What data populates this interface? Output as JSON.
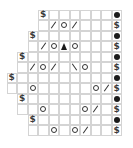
{
  "chart": {
    "columns": 11,
    "rows": [
      {
        "start": 3,
        "cells": [
          {
            "col": 3,
            "sym": "dollar"
          },
          {
            "col": 10,
            "sym": "bobble"
          }
        ]
      },
      {
        "start": 3,
        "cells": [
          {
            "col": 4,
            "sym": "k2tog"
          },
          {
            "col": 5,
            "sym": "yo"
          },
          {
            "col": 6,
            "sym": "k2tog"
          },
          {
            "col": 10,
            "sym": "dollar"
          }
        ]
      },
      {
        "start": 2,
        "cells": [
          {
            "col": 2,
            "sym": "dollar"
          },
          {
            "col": 10,
            "sym": "bobble"
          }
        ]
      },
      {
        "start": 2,
        "cells": [
          {
            "col": 3,
            "sym": "k2tog"
          },
          {
            "col": 4,
            "sym": "yo"
          },
          {
            "col": 5,
            "sym": "cdd"
          },
          {
            "col": 6,
            "sym": "yo"
          },
          {
            "col": 10,
            "sym": "dollar"
          }
        ]
      },
      {
        "start": 1,
        "cells": [
          {
            "col": 1,
            "sym": "dollar"
          },
          {
            "col": 10,
            "sym": "bobble"
          }
        ]
      },
      {
        "start": 1,
        "cells": [
          {
            "col": 2,
            "sym": "k2tog"
          },
          {
            "col": 3,
            "sym": "yo"
          },
          {
            "col": 4,
            "sym": "k2tog"
          },
          {
            "col": 6,
            "sym": "ssk"
          },
          {
            "col": 7,
            "sym": "yo"
          },
          {
            "col": 10,
            "sym": "dollar"
          }
        ]
      },
      {
        "start": 0,
        "cells": [
          {
            "col": 0,
            "sym": "dollar"
          },
          {
            "col": 10,
            "sym": "bobble"
          }
        ]
      },
      {
        "start": 0,
        "cells": [
          {
            "col": 2,
            "sym": "yo"
          },
          {
            "col": 8,
            "sym": "yo"
          },
          {
            "col": 9,
            "sym": "k2tog"
          },
          {
            "col": 10,
            "sym": "dollar"
          }
        ]
      },
      {
        "start": 1,
        "cells": [
          {
            "col": 1,
            "sym": "dollar"
          },
          {
            "col": 10,
            "sym": "bobble"
          }
        ]
      },
      {
        "start": 1,
        "cells": [
          {
            "col": 3,
            "sym": "yo"
          },
          {
            "col": 7,
            "sym": "yo"
          },
          {
            "col": 8,
            "sym": "k2tog"
          },
          {
            "col": 10,
            "sym": "dollar"
          }
        ]
      },
      {
        "start": 2,
        "cells": [
          {
            "col": 2,
            "sym": "dollar"
          },
          {
            "col": 10,
            "sym": "bobble"
          }
        ]
      },
      {
        "start": 2,
        "cells": [
          {
            "col": 4,
            "sym": "yo"
          },
          {
            "col": 6,
            "sym": "yo"
          },
          {
            "col": 7,
            "sym": "k2tog"
          },
          {
            "col": 10,
            "sym": "dollar"
          }
        ]
      }
    ],
    "symbols": {
      "dollar": {
        "name": "dollar-sign-symbol",
        "text": "$"
      },
      "bobble": {
        "name": "filled-dot-symbol",
        "text": ""
      },
      "yo": {
        "name": "open-circle-symbol",
        "text": ""
      },
      "k2tog": {
        "name": "forward-slash-symbol",
        "text": ""
      },
      "ssk": {
        "name": "back-slash-symbol",
        "text": ""
      },
      "cdd": {
        "name": "filled-triangle-symbol",
        "text": ""
      }
    }
  }
}
